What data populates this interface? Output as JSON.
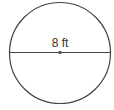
{
  "diagram": {
    "shape": "circle",
    "measurement": "diameter",
    "label": "8 ft",
    "colors": {
      "stroke": "#444444",
      "center_dot": "#555555",
      "text": "#333333"
    }
  }
}
